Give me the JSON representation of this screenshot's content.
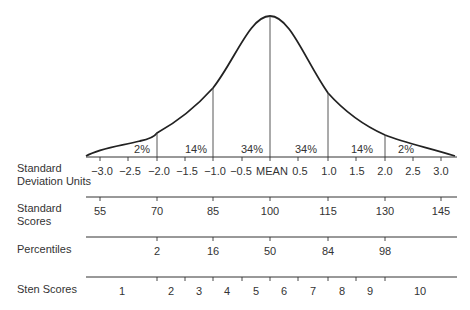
{
  "diagram": {
    "title": "",
    "colors": {
      "line": "#222222",
      "text": "#333333",
      "background": "#ffffff"
    },
    "curve": {
      "type": "normal-distribution",
      "peak_label": "MEAN"
    },
    "area_percentages": [
      {
        "label": "2%",
        "between": [
          -3.0,
          -2.0
        ]
      },
      {
        "label": "14%",
        "between": [
          -2.0,
          -1.0
        ]
      },
      {
        "label": "34%",
        "between": [
          -1.0,
          0.0
        ]
      },
      {
        "label": "34%",
        "between": [
          0.0,
          1.0
        ]
      },
      {
        "label": "14%",
        "between": [
          1.0,
          2.0
        ]
      },
      {
        "label": "2%",
        "between": [
          2.0,
          3.0
        ]
      }
    ],
    "rows": [
      {
        "label_line1": "Standard",
        "label_line2": "Deviation Units",
        "ticks": [
          "−3.0",
          "−2.5",
          "−2.0",
          "−1.5",
          "−1.0",
          "−0.5",
          "MEAN",
          "0.5",
          "1.0",
          "1.5",
          "2.0",
          "2.5",
          "3.0"
        ]
      },
      {
        "label_line1": "Standard",
        "label_line2": "Scores",
        "ticks": [
          "55",
          "70",
          "85",
          "100",
          "115",
          "130",
          "145"
        ]
      },
      {
        "label_line1": "Percentiles",
        "ticks": [
          "2",
          "16",
          "50",
          "84",
          "98"
        ]
      },
      {
        "label_line1": "Sten Scores",
        "ticks": [
          "1",
          "2",
          "3",
          "4",
          "5",
          "6",
          "7",
          "8",
          "9",
          "10"
        ]
      }
    ]
  }
}
